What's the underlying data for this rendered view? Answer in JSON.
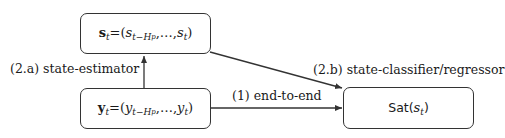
{
  "diagram": {
    "nodes": [
      {
        "id": "state",
        "label_lhs": "s",
        "label_lhs_sub": "t",
        "eq": "=",
        "open": "(",
        "item1": "s",
        "item1_sub": "t−H",
        "item1_subsub": "p",
        "sep": ",…,",
        "item2": "s",
        "item2_sub": "t",
        "close": ")"
      },
      {
        "id": "obs",
        "label_lhs": "y",
        "label_lhs_sub": "t",
        "eq": "=",
        "open": "(",
        "item1": "y",
        "item1_sub": "t−H",
        "item1_subsub": "p",
        "sep": ",…,",
        "item2": "y",
        "item2_sub": "t",
        "close": ")"
      },
      {
        "id": "sat",
        "func": "Sat",
        "open": "(",
        "arg": "s",
        "arg_sub": "t",
        "close": ")"
      }
    ],
    "edges": [
      {
        "from": "obs",
        "to": "state",
        "label": "(2.a) state-estimator"
      },
      {
        "from": "state",
        "to": "sat",
        "label": "(2.b) state-classifier/regressor"
      },
      {
        "from": "obs",
        "to": "sat",
        "label": "(1) end-to-end"
      }
    ],
    "colors": {
      "stroke": "#333333",
      "text": "#1a1a1a",
      "background": "#ffffff"
    }
  }
}
